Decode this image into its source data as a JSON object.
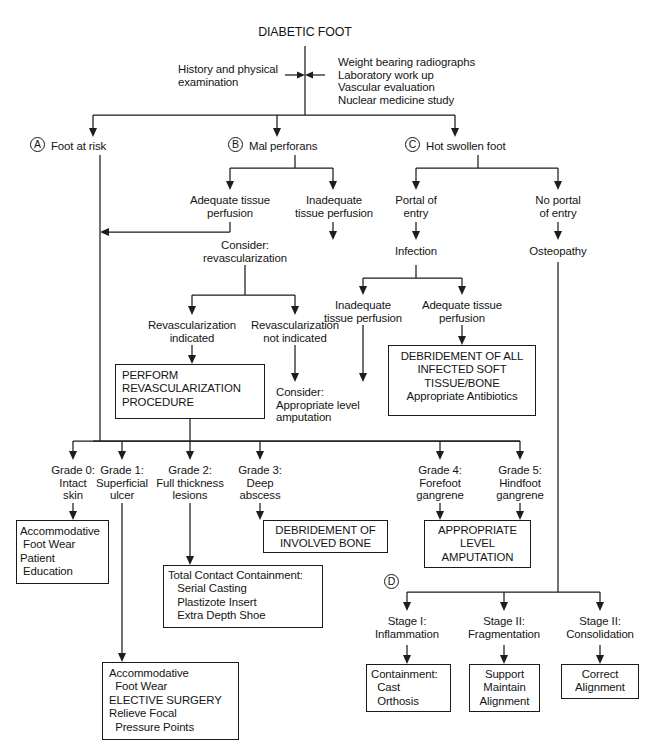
{
  "diagram": {
    "title": "DIABETIC FOOT",
    "workup_left": "History and physical\nexamination",
    "workup_right": "Weight bearing radiographs\nLaboratory work up\nVascular evaluation\nNuclear medicine study",
    "branches": [
      {
        "marker": "A",
        "label": "Foot at risk"
      },
      {
        "marker": "B",
        "label": "Mal perforans"
      },
      {
        "marker": "C",
        "label": "Hot swollen foot"
      }
    ],
    "b_children": [
      "Adequate tissue\nperfusion",
      "Inadequate\ntissue perfusion"
    ],
    "c_children": [
      "Portal of\nentry",
      "No portal\nof entry"
    ],
    "infection": "Infection",
    "osteopathy": "Osteopathy",
    "consider_revasc": "Consider:\nrevascularization",
    "revasc_options": [
      "Revascularization\nindicated",
      "Revascularization\nnot indicated"
    ],
    "infection_children": [
      "Inadequate\ntissue perfusion",
      "Adequate tissue\nperfusion"
    ],
    "consider_amputation": "Consider:\nAppropriate level\namputation",
    "box_perform_revasc": "PERFORM\nREVASCULARIZATION\nPROCEDURE",
    "box_debridement_soft": "DEBRIDEMENT OF ALL\nINFECTED SOFT\nTISSUE/BONE\nAppropriate Antibiotics",
    "grades": [
      "Grade 0:\nIntact\nskin",
      "Grade 1:\nSuperficial\nulcer",
      "Grade 2:\nFull thickness\nlesions",
      "Grade 3:\nDeep\nabscess",
      "Grade 4:\nForefoot\ngangrene",
      "Grade 5:\nHindfoot\ngangrene"
    ],
    "box_accommodative_1": "Accommodative\n Foot Wear\nPatient\n Education",
    "box_total_contact": "Total Contact Containment:\n   Serial Casting\n   Plastizote Insert\n   Extra Depth Shoe",
    "box_accommodative_2": "Accommodative\n  Foot Wear\nELECTIVE SURGERY\nRelieve Focal\n  Pressure Points",
    "box_debridement_bone": "DEBRIDEMENT OF\nINVOLVED BONE",
    "box_appropriate_level": "APPROPRIATE\nLEVEL\nAMPUTATION",
    "stage_marker": "D",
    "stages": [
      "Stage I:\nInflammation",
      "Stage II:\nFragmentation",
      "Stage II:\nConsolidation"
    ],
    "stage_boxes": [
      "Containment:\n  Cast\n  Orthosis",
      "Support\nMaintain\nAlignment",
      "Correct\nAlignment"
    ]
  }
}
